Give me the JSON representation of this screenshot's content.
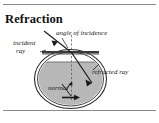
{
  "figure": {
    "title": "Refraction",
    "type": "physics-optics-diagram",
    "labels": {
      "angle_of_incidence": "angle of  incidence",
      "incident_line1": "incident",
      "incident_line2": "ray",
      "refracted_ray": "refracted ray",
      "normal": "normal"
    },
    "elements": {
      "bowl": "round fish-bowl, double outline",
      "water": "gray filled region below surface line",
      "surface_bar": "dark horizontal bar marking water surface / bowl rim",
      "normal_line": "vertical dashed line through point of incidence",
      "incident_ray": "solid line from upper-left to surface with arrowhead",
      "refracted_ray": "solid line bending from surface down-right inside water",
      "bottom_arrow": "short horizontal arrow at bowl floor"
    },
    "colors": {
      "ink": "#1a1a1a",
      "rule": "#8a8a8a",
      "water_fill": "#b8b8b8",
      "bowl_outline": "#2b2b2b",
      "surface_bar": "#3a3a3a",
      "background": "#ffffff"
    },
    "rules": {
      "top": "horizontal divider above title",
      "bottom": "horizontal divider below diagram"
    }
  }
}
